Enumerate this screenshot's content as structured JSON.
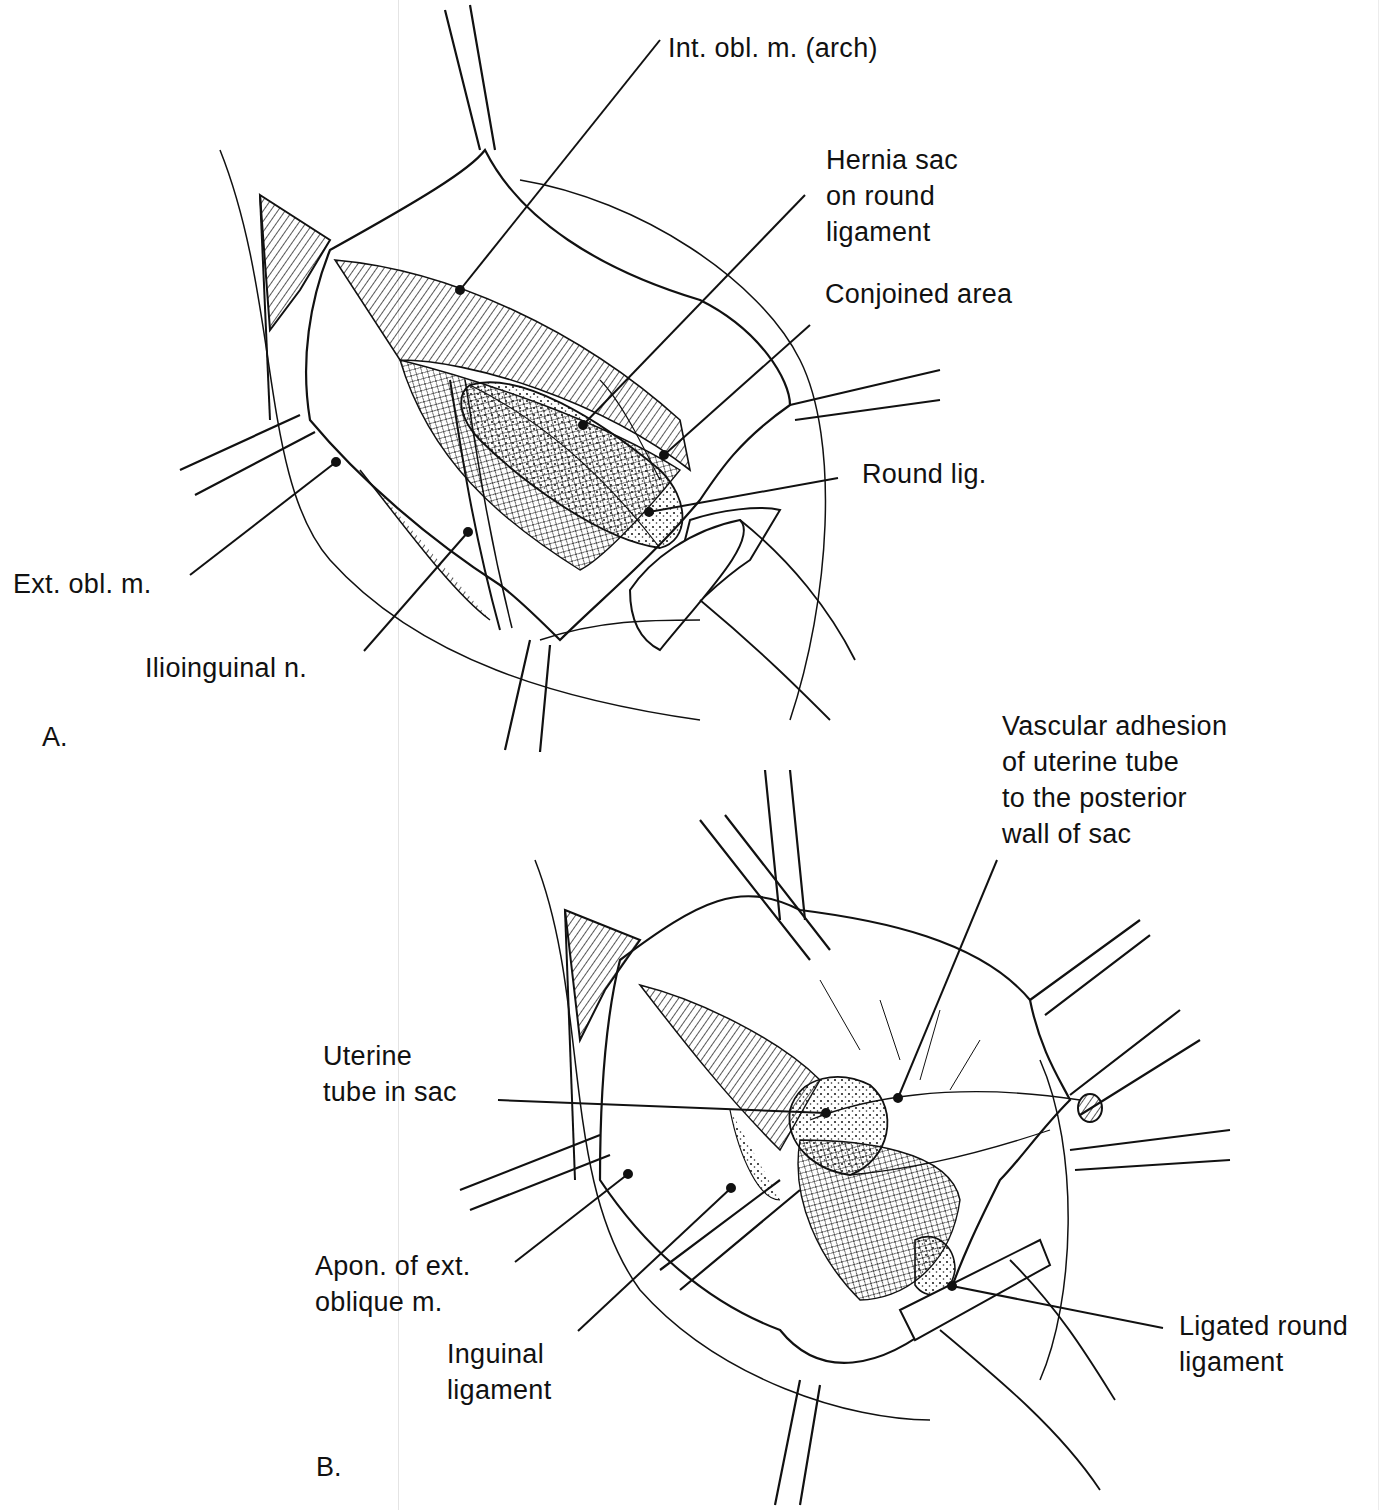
{
  "figure": {
    "panels": [
      {
        "id": "A",
        "letter": "A.",
        "labels": [
          {
            "key": "int_obl",
            "text": "Int. obl. m. (arch)"
          },
          {
            "key": "hernia_sac",
            "text": "Hernia sac\non round\nligament"
          },
          {
            "key": "conjoined",
            "text": "Conjoined area"
          },
          {
            "key": "round_lig",
            "text": "Round lig."
          },
          {
            "key": "ext_obl",
            "text": "Ext. obl. m."
          },
          {
            "key": "ilioinguinal",
            "text": "Ilioinguinal n."
          }
        ]
      },
      {
        "id": "B",
        "letter": "B.",
        "labels": [
          {
            "key": "vascular_adhesion",
            "text": "Vascular adhesion\nof uterine tube\nto the posterior\nwall of sac"
          },
          {
            "key": "uterine_tube",
            "text": "Uterine\ntube in sac"
          },
          {
            "key": "apon_ext_obl",
            "text": "Apon. of ext.\noblique m."
          },
          {
            "key": "inguinal_lig",
            "text": "Inguinal\nligament"
          },
          {
            "key": "ligated_round",
            "text": "Ligated round\nligament"
          }
        ]
      }
    ],
    "colors": {
      "ink": "#111111",
      "background": "#ffffff",
      "stipple": "#333333"
    }
  }
}
